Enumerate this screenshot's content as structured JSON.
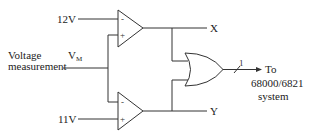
{
  "diagram": {
    "title": "",
    "colors": {
      "line": "#333333",
      "text": "#222222",
      "background": "#ffffff"
    },
    "inputs": {
      "upper_reference": "12V",
      "lower_reference": "11V",
      "measurement_label_line1": "Voltage",
      "measurement_label_line2": "measurement",
      "measurement_symbol": "V",
      "measurement_subscript": "M"
    },
    "comparators": [
      {
        "id": "upper-comparator",
        "inverting_input": "12V",
        "non_inverting_input": "VM",
        "minus_sign": "-",
        "plus_sign": "+",
        "output": "X"
      },
      {
        "id": "lower-comparator",
        "inverting_input": "VM",
        "non_inverting_input": "11V",
        "minus_sign": "-",
        "plus_sign": "+",
        "output": "Y"
      }
    ],
    "outputs": {
      "x_label": "X",
      "y_label": "Y"
    },
    "or_gate": {
      "inputs": [
        "X",
        "Y"
      ],
      "bus_width": "1"
    },
    "destination": {
      "line1": "To",
      "line2": "68000/6821",
      "line3": "system"
    }
  }
}
